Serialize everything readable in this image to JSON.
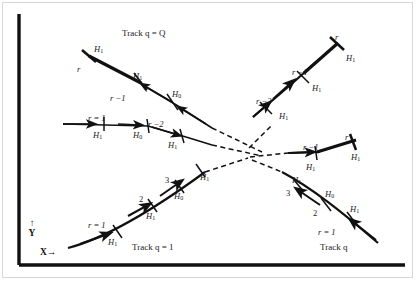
{
  "figure": {
    "kind": "particle-track-diagram",
    "width": 417,
    "height": 284,
    "background": "#ffffff",
    "border_color": "#d8d8d8",
    "ink_color": "#111111"
  },
  "axes": {
    "y_label": "↑\nY",
    "y_arrow": "↑",
    "y_name": "Y",
    "x_label": "X→",
    "x_name": "X",
    "x_arrow": "→",
    "axis_color": "#111111"
  },
  "captions": {
    "track_q_Q": "Track q = Q",
    "track_q_1": "Track q = 1",
    "track_q": "Track q"
  },
  "tracks": [
    {
      "id": "track-q-Q",
      "name": "Track q = Q",
      "caption": "Track q = Q",
      "segments": [
        "upper-left-bold-stub",
        "upper-left-descending",
        "horizontal-left-branch"
      ],
      "nodes": [
        {
          "index": "r",
          "hypothesis": "H1",
          "position": "upper-left-endpoint"
        },
        {
          "index": "r−1",
          "hypothesis": "H1",
          "position": "upper-left-mid"
        },
        {
          "index": "r−2",
          "hypothesis": "H0",
          "position": "upper-left-lower"
        }
      ]
    },
    {
      "id": "track-horizontal-left",
      "name": "horizontal left branch",
      "nodes": [
        {
          "index": "r = 1",
          "hypothesis": "H1",
          "position": "horizontal-first"
        },
        {
          "index": "r−2",
          "hypothesis": "H0",
          "position": "horizontal-second"
        },
        {
          "index": "",
          "hypothesis": "H1",
          "position": "horizontal-third"
        }
      ]
    },
    {
      "id": "track-q-1",
      "name": "Track q = 1",
      "caption": "Track q = 1",
      "nodes": [
        {
          "index": "r = 1",
          "hypothesis": "H1",
          "position": "lower-left-first"
        },
        {
          "index": "2",
          "hypothesis": "H1",
          "position": "lower-left-second"
        },
        {
          "index": "3",
          "hypothesis": "H0",
          "position": "lower-left-third"
        },
        {
          "index": "",
          "hypothesis": "H1",
          "position": "lower-left-fourth"
        }
      ]
    },
    {
      "id": "track-q",
      "name": "Track q",
      "caption": "Track q",
      "nodes": [
        {
          "index": "r = 1",
          "hypothesis": "H1",
          "position": "lower-right-first"
        },
        {
          "index": "2",
          "hypothesis": "H0",
          "position": "lower-right-second"
        },
        {
          "index": "3",
          "hypothesis": "H1",
          "position": "lower-right-third"
        }
      ]
    },
    {
      "id": "track-upper-right",
      "name": "upper right ascending track",
      "nodes": [
        {
          "index": "r−2",
          "hypothesis": "H1",
          "position": "upper-right-low"
        },
        {
          "index": "r−1",
          "hypothesis": "H1",
          "position": "upper-right-mid"
        },
        {
          "index": "r",
          "hypothesis": "H1",
          "position": "upper-right-endpoint"
        }
      ]
    },
    {
      "id": "track-middle-right",
      "name": "middle right branch",
      "nodes": [
        {
          "index": "r−1",
          "hypothesis": "H1",
          "position": "middle-right-mid"
        },
        {
          "index": "r",
          "hypothesis": "H1",
          "position": "middle-right-endpoint"
        }
      ]
    }
  ],
  "labels": [
    {
      "id": "l01",
      "text": "H",
      "sub": "1",
      "italic": true,
      "x": 94,
      "y": 45
    },
    {
      "id": "l02",
      "text": "r",
      "sub": "",
      "italic": true,
      "x": 77,
      "y": 65
    },
    {
      "id": "l03",
      "text": "H",
      "sub": "1",
      "italic": true,
      "x": 133,
      "y": 72
    },
    {
      "id": "l04",
      "text": "r −1",
      "sub": "",
      "italic": true,
      "x": 110,
      "y": 94
    },
    {
      "id": "l05",
      "text": "H",
      "sub": "0",
      "italic": true,
      "x": 172,
      "y": 90
    },
    {
      "id": "l06",
      "text": "r −2",
      "sub": "",
      "italic": true,
      "x": 148,
      "y": 120
    },
    {
      "id": "l07",
      "text": "H",
      "sub": "0",
      "italic": true,
      "x": 133,
      "y": 131
    },
    {
      "id": "l08",
      "text": "r = 1",
      "sub": "",
      "italic": true,
      "x": 88,
      "y": 114
    },
    {
      "id": "l09",
      "text": "H",
      "sub": "1",
      "italic": true,
      "x": 93,
      "y": 131
    },
    {
      "id": "l10",
      "text": "H",
      "sub": "1",
      "italic": true,
      "x": 168,
      "y": 141
    },
    {
      "id": "l11",
      "text": "r",
      "sub": "",
      "italic": true,
      "x": 335,
      "y": 33
    },
    {
      "id": "l12",
      "text": "H",
      "sub": "1",
      "italic": true,
      "x": 346,
      "y": 54
    },
    {
      "id": "l13",
      "text": "r −1",
      "sub": "",
      "italic": true,
      "x": 292,
      "y": 68
    },
    {
      "id": "l14",
      "text": "H",
      "sub": "1",
      "italic": true,
      "x": 312,
      "y": 84
    },
    {
      "id": "l15",
      "text": "r −2",
      "sub": "",
      "italic": true,
      "x": 256,
      "y": 97
    },
    {
      "id": "l16",
      "text": "H",
      "sub": "1",
      "italic": true,
      "x": 279,
      "y": 112
    },
    {
      "id": "l17",
      "text": "r",
      "sub": "",
      "italic": true,
      "x": 345,
      "y": 133
    },
    {
      "id": "l18",
      "text": "H",
      "sub": "1",
      "italic": true,
      "x": 351,
      "y": 153
    },
    {
      "id": "l19",
      "text": "r −1",
      "sub": "",
      "italic": true,
      "x": 303,
      "y": 143
    },
    {
      "id": "l20",
      "text": "H",
      "sub": "1",
      "italic": true,
      "x": 306,
      "y": 163
    },
    {
      "id": "l21",
      "text": "H",
      "sub": "1",
      "italic": true,
      "x": 200,
      "y": 173
    },
    {
      "id": "l22",
      "text": "3",
      "sub": "",
      "italic": false,
      "x": 165,
      "y": 176
    },
    {
      "id": "l23",
      "text": "H",
      "sub": "0",
      "italic": true,
      "x": 174,
      "y": 192
    },
    {
      "id": "l24",
      "text": "2",
      "sub": "",
      "italic": false,
      "x": 139,
      "y": 195
    },
    {
      "id": "l25",
      "text": "H",
      "sub": "1",
      "italic": true,
      "x": 146,
      "y": 212
    },
    {
      "id": "l26",
      "text": "r = 1",
      "sub": "",
      "italic": true,
      "x": 88,
      "y": 221
    },
    {
      "id": "l27",
      "text": "H",
      "sub": "1",
      "italic": true,
      "x": 108,
      "y": 238
    },
    {
      "id": "l28",
      "text": "H",
      "sub": "1",
      "italic": true,
      "x": 292,
      "y": 176
    },
    {
      "id": "l29",
      "text": "3",
      "sub": "",
      "italic": false,
      "x": 286,
      "y": 189
    },
    {
      "id": "l30",
      "text": "H",
      "sub": "0",
      "italic": true,
      "x": 325,
      "y": 190
    },
    {
      "id": "l31",
      "text": "2",
      "sub": "",
      "italic": false,
      "x": 313,
      "y": 209
    },
    {
      "id": "l32",
      "text": "H",
      "sub": "1",
      "italic": true,
      "x": 350,
      "y": 205
    },
    {
      "id": "l33",
      "text": "r = 1",
      "sub": "",
      "italic": true,
      "x": 318,
      "y": 228
    }
  ]
}
